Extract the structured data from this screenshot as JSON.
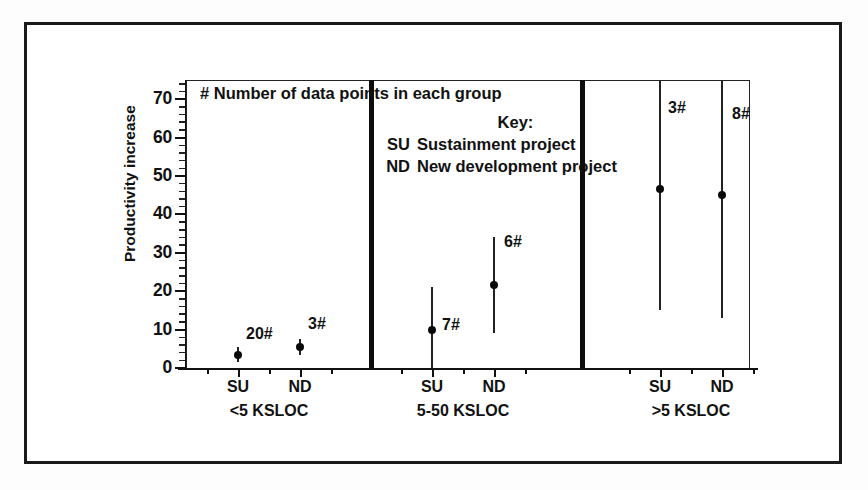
{
  "figure": {
    "note": "# Number of data points in each group",
    "key_title": "Key:",
    "key_entries": [
      {
        "abbr": "SU",
        "desc": "Sustainment project"
      },
      {
        "abbr": "ND",
        "desc": "New development project"
      }
    ]
  },
  "chart_data": {
    "type": "scatter",
    "title": "",
    "xlabel": "",
    "ylabel": "Productivity increase",
    "ylim": [
      0,
      75
    ],
    "yticks": [
      0,
      10,
      20,
      30,
      40,
      50,
      60,
      70
    ],
    "ytick_labels": [
      "0",
      "10",
      "20",
      "30",
      "40",
      "50",
      "60",
      "70"
    ],
    "minor_tick_step": 2,
    "grid": false,
    "legend_position": "inside-top-center",
    "groups": [
      {
        "name": "<5 KSLOC",
        "points": [
          {
            "x_label": "SU",
            "value": 3.5,
            "low": 1.5,
            "high": 5.5,
            "count_label": "20#"
          },
          {
            "x_label": "ND",
            "value": 5.5,
            "low": 3.5,
            "high": 7.5,
            "count_label": "3#"
          }
        ]
      },
      {
        "name": "5-50 KSLOC",
        "points": [
          {
            "x_label": "SU",
            "value": 10,
            "low": 0,
            "high": 21,
            "count_label": "7#"
          },
          {
            "x_label": "ND",
            "value": 21.5,
            "low": 9,
            "high": 34,
            "count_label": "6#"
          }
        ]
      },
      {
        "name": ">5 KSLOC",
        "points": [
          {
            "x_label": "SU",
            "value": 46.5,
            "low": 15,
            "high": 75,
            "count_label": "3#"
          },
          {
            "x_label": "ND",
            "value": 45,
            "low": 13,
            "high": 75,
            "count_label": "8#"
          }
        ]
      }
    ],
    "annotations": [
      "# Number of data points in each group",
      "Key:",
      "SU Sustainment project",
      "ND New development project"
    ]
  },
  "colors": {
    "ink": "#111111",
    "frame": "#1a1a1a",
    "marker": "#0a0a0a",
    "background": "#ffffff"
  }
}
